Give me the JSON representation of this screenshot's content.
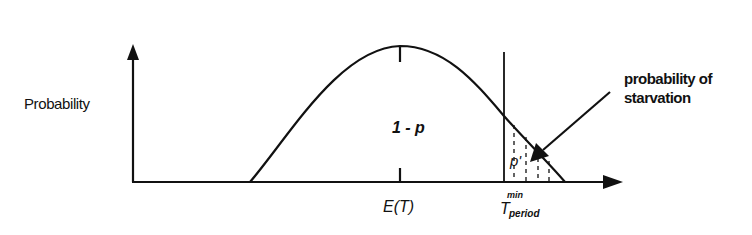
{
  "diagram": {
    "type": "probability-distribution",
    "y_axis_label": "Probability",
    "region_labels": {
      "main_area": "1 - p",
      "tail_area": "p'"
    },
    "x_axis_ticks": {
      "mean": "E(T)",
      "threshold_main": "T",
      "threshold_subscript": "period",
      "threshold_superscript": "min"
    },
    "annotation": {
      "line1": "probability of",
      "line2": "starvation"
    },
    "colors": {
      "ink": "#111111",
      "background": "#ffffff"
    }
  }
}
